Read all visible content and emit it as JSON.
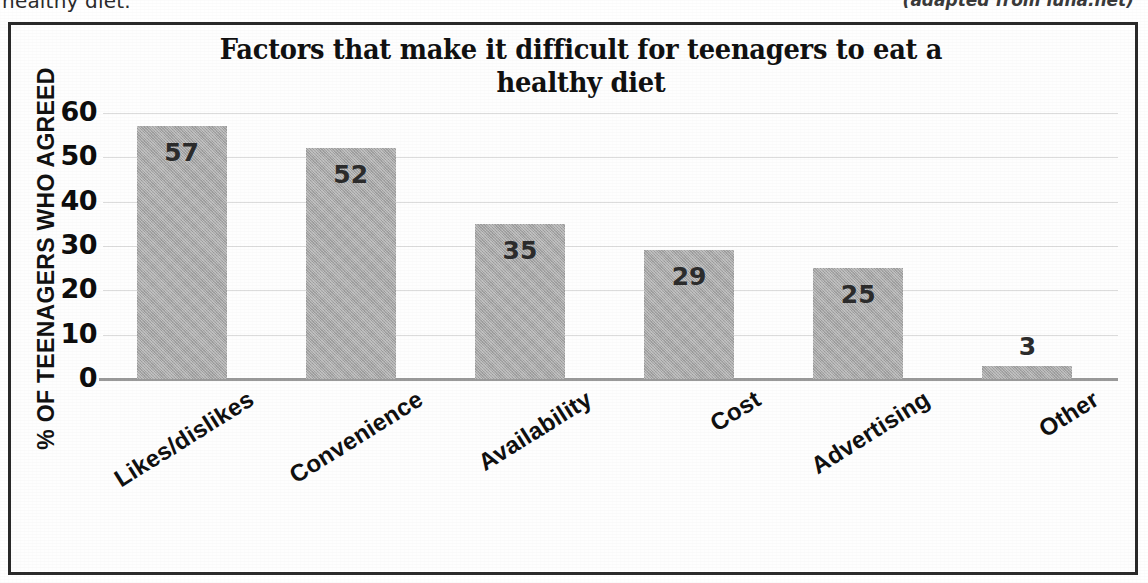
{
  "page": {
    "clipped_text_left": "healthy diet.",
    "attribution": "(adapted from luna.net)"
  },
  "chart_data": {
    "type": "bar",
    "title": "Factors that make it difficult for teenagers to eat a healthy diet",
    "xlabel": "",
    "ylabel": "% OF TEENAGERS WHO AGREED",
    "categories": [
      "Likes/dislikes",
      "Convenience",
      "Availability",
      "Cost",
      "Advertising",
      "Other"
    ],
    "values": [
      57,
      52,
      35,
      29,
      25,
      3
    ],
    "value_labels": [
      "57",
      "52",
      "35",
      "29",
      "25",
      "3"
    ],
    "ylim": [
      0,
      60
    ],
    "yticks": [
      60,
      50,
      40,
      30,
      20,
      10,
      0
    ],
    "ytick_labels": [
      "60",
      "50",
      "40",
      "30",
      "20",
      "10",
      "0"
    ],
    "grid": true,
    "legend": false,
    "legend_position": "none",
    "bar_color": "#a8a8a8",
    "label_color": "#2c2c2c",
    "grid_color": "#dcdcdc",
    "axis_color": "#9a9a9a",
    "text_color": "#101010"
  }
}
